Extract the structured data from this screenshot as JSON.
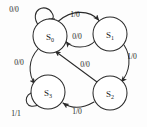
{
  "diagram": {
    "stroke_color": "#2b2b2b",
    "node_fill": "#ffffff",
    "background": "#fdfdfd",
    "states": [
      {
        "id": "S0",
        "name": "S",
        "sub": "0",
        "cx": 50,
        "cy": 36,
        "r": 17
      },
      {
        "id": "S1",
        "name": "S",
        "sub": "1",
        "cx": 110,
        "cy": 34,
        "r": 17
      },
      {
        "id": "S2",
        "name": "S",
        "sub": "2",
        "cx": 110,
        "cy": 93,
        "r": 17
      },
      {
        "id": "S3",
        "name": "S",
        "sub": "3",
        "cx": 48,
        "cy": 92,
        "r": 17
      }
    ],
    "transitions": [
      {
        "id": "t-s0-self",
        "from": "S0",
        "to": "S0",
        "label": "0/0",
        "lx": 14,
        "ly": 12
      },
      {
        "id": "t-s0-s1",
        "from": "S0",
        "to": "S1",
        "label": "1/0",
        "lx": 75,
        "ly": 17
      },
      {
        "id": "t-s1-s0",
        "from": "S1",
        "to": "S0",
        "label": "0/0",
        "lx": 77,
        "ly": 39
      },
      {
        "id": "t-s1-s2",
        "from": "S1",
        "to": "S2",
        "label": "1/0",
        "lx": 132,
        "ly": 59
      },
      {
        "id": "t-s0-s3",
        "from": "S0",
        "to": "S3",
        "label": "0/0",
        "lx": 19,
        "ly": 65
      },
      {
        "id": "t-s2-s0",
        "from": "S2",
        "to": "S0",
        "label": "0/0",
        "lx": 85,
        "ly": 67
      },
      {
        "id": "t-s2-s3",
        "from": "S2",
        "to": "S3",
        "label": "1/0",
        "lx": 77,
        "ly": 114
      },
      {
        "id": "t-s3-self",
        "from": "S3",
        "to": "S3",
        "label": "1/1",
        "lx": 16,
        "ly": 116
      }
    ]
  }
}
